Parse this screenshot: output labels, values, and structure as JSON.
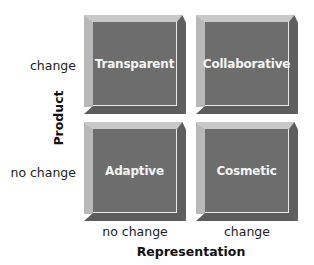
{
  "diagram": {
    "y_axis": {
      "title": "Product",
      "labels": [
        "change",
        "no change"
      ]
    },
    "x_axis": {
      "title": "Representation",
      "labels": [
        "no change",
        "change"
      ]
    },
    "cells": [
      {
        "label": "Transparent",
        "row": "change",
        "col": "no change"
      },
      {
        "label": "Collaborative",
        "row": "change",
        "col": "change"
      },
      {
        "label": "Adaptive",
        "row": "no change",
        "col": "no change"
      },
      {
        "label": "Cosmetic",
        "row": "no change",
        "col": "change"
      }
    ],
    "colors": {
      "face": "#6d6d6d",
      "bevel_light": "#c9c9c9",
      "bevel_dark": "#5f5f5f",
      "text": "#f4f4f4"
    }
  }
}
